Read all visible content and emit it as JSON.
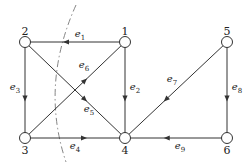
{
  "diagram": {
    "type": "directed-graph",
    "colors": {
      "stroke": "#333333",
      "node_fill": "#ffffff",
      "cut": "#777777"
    },
    "nodes": [
      {
        "id": "1",
        "label": "1",
        "x": 125,
        "y": 42,
        "label_x": 125,
        "label_y": 31
      },
      {
        "id": "2",
        "label": "2",
        "x": 25,
        "y": 42,
        "label_x": 25,
        "label_y": 31
      },
      {
        "id": "3",
        "label": "3",
        "x": 25,
        "y": 138,
        "label_x": 25,
        "label_y": 150
      },
      {
        "id": "4",
        "label": "4",
        "x": 125,
        "y": 138,
        "label_x": 125,
        "label_y": 150
      },
      {
        "id": "5",
        "label": "5",
        "x": 227,
        "y": 42,
        "label_x": 227,
        "label_y": 31
      },
      {
        "id": "6",
        "label": "6",
        "x": 227,
        "y": 138,
        "label_x": 227,
        "label_y": 150
      }
    ],
    "edges": [
      {
        "id": "e1",
        "base": "e",
        "sub": "1",
        "from": "1",
        "to": "2",
        "label_x": 80,
        "label_y": 35
      },
      {
        "id": "e2",
        "base": "e",
        "sub": "2",
        "from": "1",
        "to": "4",
        "label_x": 135,
        "label_y": 88
      },
      {
        "id": "e3",
        "base": "e",
        "sub": "3",
        "from": "2",
        "to": "3",
        "label_x": 15,
        "label_y": 88
      },
      {
        "id": "e4",
        "base": "e",
        "sub": "4",
        "from": "3",
        "to": "4",
        "label_x": 75,
        "label_y": 147
      },
      {
        "id": "e5",
        "base": "e",
        "sub": "5",
        "from": "2",
        "to": "4",
        "label_x": 89,
        "label_y": 110
      },
      {
        "id": "e6",
        "base": "e",
        "sub": "6",
        "from": "3",
        "to": "1",
        "label_x": 84,
        "label_y": 66
      },
      {
        "id": "e7",
        "base": "e",
        "sub": "7",
        "from": "5",
        "to": "4",
        "label_x": 172,
        "label_y": 80
      },
      {
        "id": "e8",
        "base": "e",
        "sub": "8",
        "from": "5",
        "to": "6",
        "label_x": 237,
        "label_y": 88
      },
      {
        "id": "e9",
        "base": "e",
        "sub": "9",
        "from": "6",
        "to": "4",
        "label_x": 180,
        "label_y": 147
      }
    ],
    "cut_curve": {
      "style": "dashed",
      "path": "M 76 5 Q 40 85 66 162"
    }
  }
}
